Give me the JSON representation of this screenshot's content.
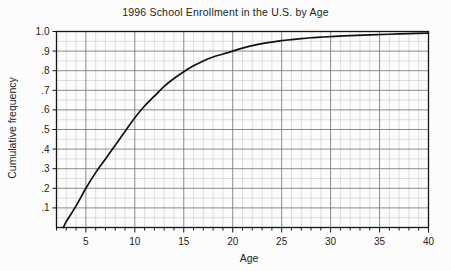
{
  "chart_data": {
    "type": "line",
    "title": "1996 School Enrollment in the U.S. by Age",
    "xlabel": "Age",
    "ylabel": "Cumulative frequency",
    "xlim": [
      2,
      40
    ],
    "ylim": [
      0.0,
      1.0
    ],
    "grid": true,
    "grid_x_step": 1,
    "grid_y_step": 0.05,
    "legend": "none",
    "x_tick_labels": [
      "5",
      "10",
      "15",
      "20",
      "25",
      "30",
      "35",
      "40"
    ],
    "x_tick_values": [
      5,
      10,
      15,
      20,
      25,
      30,
      35,
      40
    ],
    "y_tick_labels": [
      "1.0",
      ".9",
      ".8",
      ".7",
      ".6",
      ".5",
      ".4",
      ".3",
      ".2",
      ".1"
    ],
    "y_tick_values": [
      1.0,
      0.9,
      0.8,
      0.7,
      0.6,
      0.5,
      0.4,
      0.3,
      0.2,
      0.1
    ],
    "series": [
      {
        "name": "Cumulative frequency of school enrollment",
        "x": [
          2.7,
          3,
          4,
          5,
          6,
          7,
          8,
          9,
          10,
          11,
          12,
          13,
          14,
          15,
          16,
          17,
          18,
          19,
          20,
          21,
          22,
          23,
          24,
          25,
          26,
          27,
          28,
          29,
          30,
          32,
          34,
          36,
          38,
          40
        ],
        "y": [
          0.0,
          0.03,
          0.11,
          0.2,
          0.28,
          0.35,
          0.42,
          0.49,
          0.56,
          0.62,
          0.67,
          0.72,
          0.76,
          0.795,
          0.825,
          0.85,
          0.87,
          0.885,
          0.9,
          0.915,
          0.928,
          0.938,
          0.946,
          0.953,
          0.959,
          0.964,
          0.968,
          0.971,
          0.974,
          0.979,
          0.983,
          0.986,
          0.989,
          0.992
        ]
      }
    ],
    "colors": {
      "curve": "#111111",
      "grid_major": "#6e6e6e",
      "grid_minor": "#c9c9c9",
      "frame": "#151515",
      "background": "#fcfcfc",
      "text": "#232323"
    }
  }
}
